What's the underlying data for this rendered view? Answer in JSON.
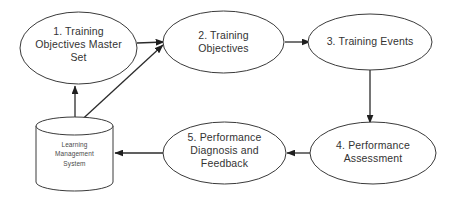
{
  "diagram": {
    "background_color": "#ffffff",
    "stroke_color": "#3a3a3a",
    "text_color": "#333333",
    "nodes": [
      {
        "id": "node-1",
        "shape": "ellipse",
        "label": "1. Training\nObjectives Master\nSet"
      },
      {
        "id": "node-2",
        "shape": "ellipse",
        "label": "2.  Training\nObjectives"
      },
      {
        "id": "node-3",
        "shape": "ellipse",
        "label": "3. Training Events"
      },
      {
        "id": "node-4",
        "shape": "ellipse",
        "label": "4.  Performance\nAssessment"
      },
      {
        "id": "node-5",
        "shape": "ellipse",
        "label": "5.  Performance\nDiagnosis and\nFeedback"
      },
      {
        "id": "node-store",
        "shape": "cylinder",
        "label": "Learning\nManagement\nSystem"
      }
    ],
    "edges": [
      {
        "id": "edge-1-to-2",
        "from": "node-1",
        "to": "node-2",
        "style": "solid-arrow"
      },
      {
        "id": "edge-2-to-3",
        "from": "node-2",
        "to": "node-3",
        "style": "solid-arrow"
      },
      {
        "id": "edge-3-to-4",
        "from": "node-3",
        "to": "node-4",
        "style": "solid-arrow"
      },
      {
        "id": "edge-4-to-5",
        "from": "node-4",
        "to": "node-5",
        "style": "solid-arrow"
      },
      {
        "id": "edge-5-to-store",
        "from": "node-5",
        "to": "node-store",
        "style": "solid-arrow"
      },
      {
        "id": "edge-store-to-1",
        "from": "node-store",
        "to": "node-1",
        "style": "solid-arrow"
      },
      {
        "id": "edge-store-to-2",
        "from": "node-store",
        "to": "node-2",
        "style": "solid-arrow"
      }
    ]
  }
}
